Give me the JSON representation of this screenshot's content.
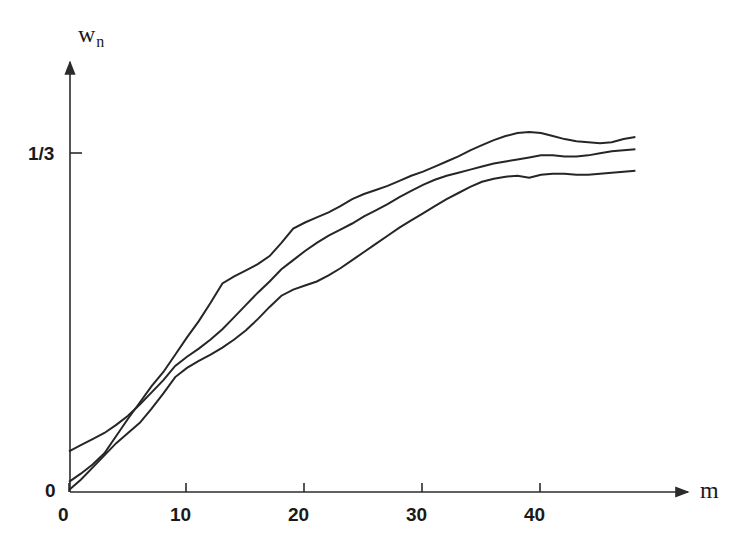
{
  "figure": {
    "background_color": "#ffffff",
    "line_color": "#262626",
    "axis_color": "#2b2b2b"
  },
  "axes": {
    "y_axis_label": "w",
    "y_axis_label_subscript": "n",
    "x_axis_label": "m",
    "origin_label": "0",
    "y_tick_label": "1/3",
    "x_tick_labels": [
      "0",
      "10",
      "20",
      "30",
      "40"
    ]
  },
  "chart_data": {
    "type": "line",
    "title": "",
    "subtitle": "",
    "xlabel": "m",
    "ylabel": "w_n",
    "xlim": [
      0,
      48
    ],
    "ylim": [
      0,
      0.42
    ],
    "grid": false,
    "legend": null,
    "annotations": [],
    "x_ticks": [
      0,
      10,
      20,
      30,
      40
    ],
    "y_ticks": [
      0.3333
    ],
    "y_tick_labels": [
      "1/3"
    ],
    "x_tick_labels": [
      "0",
      "10",
      "20",
      "30",
      "40"
    ],
    "axis_style": "arrow-ended open axes",
    "note": "Three monotone step-like curves converging toward 1/3",
    "series": [
      {
        "name": "curve-upper",
        "x": [
          0,
          1,
          2,
          3,
          4,
          5,
          6,
          7,
          8,
          9,
          10,
          11,
          12,
          13,
          14,
          15,
          16,
          17,
          18,
          19,
          20,
          21,
          22,
          23,
          24,
          25,
          26,
          27,
          28,
          29,
          30,
          31,
          32,
          33,
          34,
          35,
          36,
          37,
          38,
          39,
          40,
          41,
          42,
          43,
          44,
          45,
          46,
          47,
          48
        ],
        "y": [
          0.01,
          0.018,
          0.027,
          0.038,
          0.055,
          0.072,
          0.088,
          0.104,
          0.118,
          0.135,
          0.152,
          0.168,
          0.186,
          0.205,
          0.212,
          0.218,
          0.224,
          0.232,
          0.245,
          0.259,
          0.265,
          0.27,
          0.275,
          0.281,
          0.288,
          0.293,
          0.297,
          0.301,
          0.306,
          0.311,
          0.315,
          0.32,
          0.325,
          0.33,
          0.336,
          0.341,
          0.346,
          0.35,
          0.353,
          0.354,
          0.353,
          0.35,
          0.347,
          0.345,
          0.344,
          0.343,
          0.344,
          0.347,
          0.349
        ]
      },
      {
        "name": "curve-middle",
        "x": [
          0,
          1,
          2,
          3,
          4,
          5,
          6,
          7,
          8,
          9,
          10,
          11,
          12,
          13,
          14,
          15,
          16,
          17,
          18,
          19,
          20,
          21,
          22,
          23,
          24,
          25,
          26,
          27,
          28,
          29,
          30,
          31,
          32,
          33,
          34,
          35,
          36,
          37,
          38,
          39,
          40,
          41,
          42,
          43,
          44,
          45,
          46,
          47,
          48
        ],
        "y": [
          0.04,
          0.046,
          0.052,
          0.058,
          0.066,
          0.075,
          0.086,
          0.098,
          0.11,
          0.124,
          0.133,
          0.141,
          0.15,
          0.16,
          0.172,
          0.184,
          0.196,
          0.207,
          0.219,
          0.228,
          0.237,
          0.245,
          0.252,
          0.258,
          0.264,
          0.271,
          0.277,
          0.283,
          0.29,
          0.296,
          0.302,
          0.307,
          0.311,
          0.314,
          0.317,
          0.32,
          0.323,
          0.325,
          0.327,
          0.329,
          0.331,
          0.331,
          0.33,
          0.33,
          0.331,
          0.333,
          0.335,
          0.336,
          0.337
        ]
      },
      {
        "name": "curve-lower",
        "x": [
          0,
          1,
          2,
          3,
          4,
          5,
          6,
          7,
          8,
          9,
          10,
          11,
          12,
          13,
          14,
          15,
          16,
          17,
          18,
          19,
          20,
          21,
          22,
          23,
          24,
          25,
          26,
          27,
          28,
          29,
          30,
          31,
          32,
          33,
          34,
          35,
          36,
          37,
          38,
          39,
          40,
          41,
          42,
          43,
          44,
          45,
          46,
          47,
          48
        ],
        "y": [
          0.002,
          0.012,
          0.024,
          0.036,
          0.048,
          0.058,
          0.068,
          0.082,
          0.097,
          0.113,
          0.122,
          0.129,
          0.135,
          0.142,
          0.15,
          0.159,
          0.17,
          0.182,
          0.193,
          0.199,
          0.203,
          0.207,
          0.213,
          0.22,
          0.228,
          0.236,
          0.244,
          0.252,
          0.26,
          0.267,
          0.274,
          0.281,
          0.288,
          0.294,
          0.3,
          0.305,
          0.308,
          0.31,
          0.311,
          0.309,
          0.312,
          0.313,
          0.313,
          0.312,
          0.312,
          0.313,
          0.314,
          0.315,
          0.316
        ]
      }
    ]
  }
}
